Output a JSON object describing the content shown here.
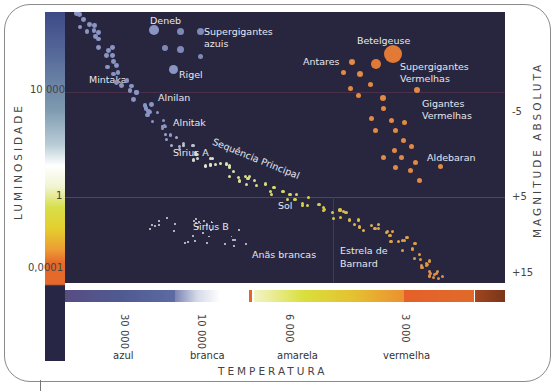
{
  "diagram": {
    "type": "hertzsprung-russell",
    "left_axis": {
      "title": "LUMINOSIDADE",
      "ticks": [
        {
          "label": "10 000",
          "y": 92
        },
        {
          "label": "1",
          "y": 197
        },
        {
          "label": "0,0001",
          "y": 268
        }
      ]
    },
    "right_axis": {
      "title": "MAGNITUDE ABSOLUTA",
      "ticks": [
        {
          "label": "-5",
          "y": 112
        },
        {
          "label": "+5",
          "y": 197
        },
        {
          "label": "+15",
          "y": 273
        }
      ]
    },
    "bottom_axis": {
      "title": "TEMPERATURA",
      "ticks": [
        {
          "label": "30 000",
          "x": 124
        },
        {
          "label": "10 000",
          "x": 201
        },
        {
          "label": "6 000",
          "x": 289
        },
        {
          "label": "3 000",
          "x": 405
        }
      ],
      "color_names": [
        {
          "label": "azul",
          "x": 113
        },
        {
          "label": "branca",
          "x": 190
        },
        {
          "label": "amarela",
          "x": 277
        },
        {
          "label": "vermelha",
          "x": 383
        }
      ]
    },
    "labels": {
      "deneb": "Deneb",
      "blue_supergiants_1": "Supergigantes",
      "blue_supergiants_2": "azuis",
      "rigel": "Rigel",
      "mintaka": "Mintaka",
      "alnilan": "Alnilan",
      "alnitak": "Alnitak",
      "sirius_a": "Sirius A",
      "main_sequence": "Sequência Principal",
      "sol": "Sol",
      "sirius_b": "Sirius B",
      "white_dwarfs": "Anãs brancas",
      "barnard_1": "Estrela de",
      "barnard_2": "Barnard",
      "betelgeuse": "Betelgeuse",
      "antares": "Antares",
      "red_supergiants_1": "Supergigantes",
      "red_supergiants_2": "Vermelhas",
      "red_giants_1": "Gigantes",
      "red_giants_2": "Vermelhas",
      "aldebaran": "Aldebaran"
    },
    "colors": {
      "background": "#28263f",
      "blue_star": "#8a95c4",
      "white_star": "#e8ecd8",
      "yellow_star": "#d9d24a",
      "orange_star": "#e08a45",
      "red_star": "#e27a35"
    }
  }
}
